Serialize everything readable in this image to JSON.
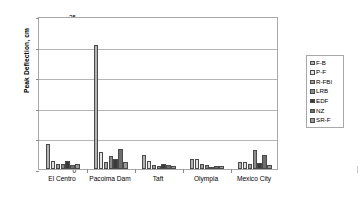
{
  "chart_data": {
    "type": "bar",
    "title": "",
    "xlabel": "",
    "ylabel": "Peak Deflection, cm",
    "ylim": [
      0,
      25
    ],
    "yticks": [
      0,
      5,
      10,
      15,
      20,
      25
    ],
    "grid": true,
    "legend_position": "right",
    "categories": [
      "El Centro",
      "Pacoima Dam",
      "Taft",
      "Olympia",
      "Mexico City"
    ],
    "series": [
      {
        "name": "F-B",
        "color": "#b4b4b4",
        "values": [
          4.1,
          20.2,
          2.3,
          1.7,
          1.2
        ]
      },
      {
        "name": "P-F",
        "color": "#e2e2e2",
        "values": [
          1.3,
          2.7,
          1.3,
          1.6,
          1.2
        ]
      },
      {
        "name": "R-FBI",
        "color": "#a0a0a0",
        "values": [
          0.8,
          1.2,
          0.6,
          0.8,
          0.9
        ]
      },
      {
        "name": "LRB",
        "color": "#8c8c8c",
        "values": [
          0.9,
          2.2,
          0.5,
          0.6,
          3.1
        ]
      },
      {
        "name": "EDF",
        "color": "#3a3a3a",
        "values": [
          1.3,
          1.7,
          0.8,
          0.4,
          1.0
        ]
      },
      {
        "name": "NZ",
        "color": "#6e6e6e",
        "values": [
          0.7,
          3.2,
          0.6,
          0.5,
          2.3
        ]
      },
      {
        "name": "SR-F",
        "color": "#9a9a9a",
        "values": [
          0.8,
          1.2,
          0.5,
          0.5,
          0.7
        ]
      }
    ]
  },
  "axis": {
    "y_title": "Peak Deflection, cm",
    "tick_labels": [
      "0",
      "5",
      "10",
      "15",
      "20",
      "25"
    ]
  },
  "legend": {
    "items": [
      {
        "label": "F-B"
      },
      {
        "label": "P-F"
      },
      {
        "label": "R-FBI"
      },
      {
        "label": "LRB"
      },
      {
        "label": "EDF"
      },
      {
        "label": "NZ"
      },
      {
        "label": "SR-F"
      }
    ]
  }
}
